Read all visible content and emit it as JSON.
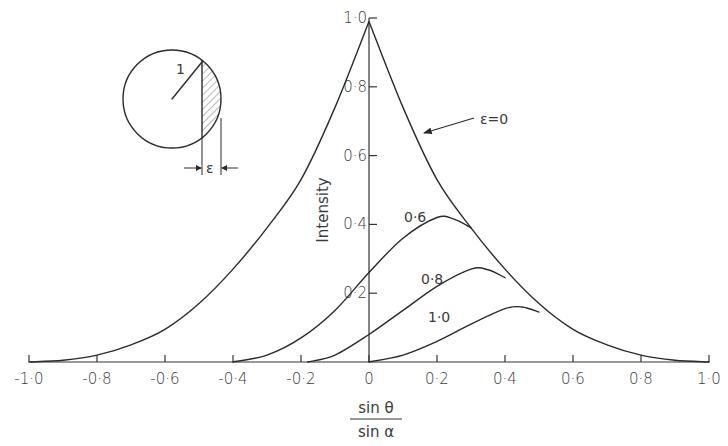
{
  "chart_data": {
    "type": "line",
    "title": "",
    "xlabel": "sin θ / sin α",
    "xlabel_numerator": "sin θ",
    "xlabel_denominator": "sin α",
    "ylabel": "Intensity",
    "xlim": [
      -1.0,
      1.0
    ],
    "ylim": [
      0,
      1.0
    ],
    "grid": false,
    "legend": "inline curve labels",
    "x_ticks": [
      -1.0,
      -0.8,
      -0.6,
      -0.4,
      -0.2,
      0,
      0.2,
      0.4,
      0.6,
      0.8,
      1.0
    ],
    "x_tick_labels": [
      "-1·0",
      "-0·8",
      "-0·6",
      "-0·4",
      "-0·2",
      "0",
      "0·2",
      "0·4",
      "0·6",
      "0·8",
      "1·0"
    ],
    "y_ticks": [
      0.2,
      0.4,
      0.6,
      0.8,
      1.0
    ],
    "y_tick_labels": [
      "0·2",
      "0·4",
      "0·6",
      "0·8",
      "1·0"
    ],
    "series": [
      {
        "name": "ε=0",
        "label": "ε=0",
        "x": [
          -1.0,
          -0.9,
          -0.8,
          -0.7,
          -0.6,
          -0.5,
          -0.4,
          -0.3,
          -0.2,
          -0.1,
          0.0,
          0.1,
          0.2,
          0.3,
          0.4,
          0.5,
          0.6,
          0.7,
          0.8,
          0.9,
          1.0
        ],
        "y": [
          0.0,
          0.005,
          0.02,
          0.05,
          0.095,
          0.17,
          0.27,
          0.39,
          0.53,
          0.74,
          0.99,
          0.74,
          0.53,
          0.39,
          0.27,
          0.17,
          0.095,
          0.05,
          0.02,
          0.005,
          0.0
        ]
      },
      {
        "name": "ε=0.6",
        "label": "0·6",
        "x": [
          -0.4,
          -0.3,
          -0.2,
          -0.1,
          0.0,
          0.1,
          0.2,
          0.25,
          0.3
        ],
        "y": [
          0.0,
          0.02,
          0.07,
          0.15,
          0.26,
          0.36,
          0.42,
          0.415,
          0.39
        ]
      },
      {
        "name": "ε=0.8",
        "label": "0·8",
        "x": [
          -0.18,
          -0.1,
          0.0,
          0.1,
          0.2,
          0.3,
          0.35,
          0.4
        ],
        "y": [
          0.0,
          0.02,
          0.08,
          0.15,
          0.22,
          0.27,
          0.268,
          0.245
        ]
      },
      {
        "name": "ε=1.0",
        "label": "1·0",
        "x": [
          0.0,
          0.1,
          0.2,
          0.3,
          0.4,
          0.45,
          0.5
        ],
        "y": [
          0.0,
          0.02,
          0.06,
          0.11,
          0.155,
          0.16,
          0.145
        ]
      }
    ],
    "annotations": [
      {
        "text": "ε=0",
        "arrow_to_series": "ε=0"
      },
      {
        "text": "1",
        "context": "inset circle radius"
      },
      {
        "text": "ε",
        "context": "inset circle chord width (shaded segment)"
      }
    ]
  },
  "inset": {
    "radius_label": "1",
    "width_label": "ε"
  },
  "labels": {
    "eps0": "ε=0",
    "c06": "0·6",
    "c08": "0·8",
    "c10": "1·0",
    "ylabel": "Intensity",
    "x_num": "sin θ",
    "x_den": "sin α"
  },
  "colors": {
    "ink": "#2a2a2a",
    "background": "#ffffff"
  }
}
